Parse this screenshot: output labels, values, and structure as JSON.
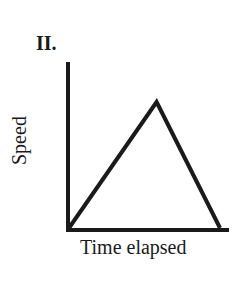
{
  "panel": {
    "label": "II."
  },
  "chart_data": {
    "type": "line",
    "title": "II.",
    "xlabel": "Time elapsed",
    "ylabel": "Speed",
    "x": [
      0,
      0.58,
      1.0
    ],
    "series": [
      {
        "name": "Speed",
        "values": [
          0,
          1.0,
          0
        ]
      }
    ],
    "grid": false,
    "ticks": false,
    "note": "Speed rises linearly from zero to a peak, then falls linearly back to zero (triangular profile); peak occurs at ~58% of elapsed time"
  },
  "colors": {
    "line": "#1a1a1a",
    "axis": "#1a1a1a",
    "background": "#ffffff"
  }
}
